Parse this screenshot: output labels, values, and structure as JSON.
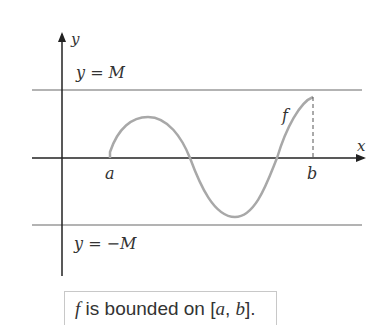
{
  "diagram": {
    "axes": {
      "x_label": "x",
      "y_label": "y"
    },
    "bounds": {
      "upper_label": "y = M",
      "lower_label": "y = −M"
    },
    "function_label": "f",
    "interval": {
      "a_label": "a",
      "b_label": "b"
    },
    "caption": {
      "f": "f",
      "text": " is bounded on ",
      "interval_open": "[",
      "a": "a",
      "comma": ", ",
      "b": "b",
      "interval_close": "]."
    },
    "colors": {
      "axis": "#222222",
      "bound_line": "#b3b3b3",
      "curve": "#a8a8a8",
      "text": "#333333"
    }
  }
}
